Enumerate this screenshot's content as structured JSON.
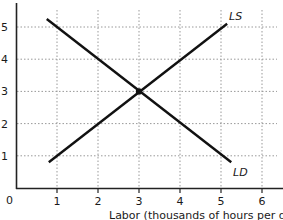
{
  "chart_data": {
    "type": "line",
    "title": "",
    "xlabel": "Labor (thousands of hours per day",
    "ylabel": "",
    "origin_label": "0",
    "xlim": [
      0,
      6.5
    ],
    "ylim": [
      0,
      5.7
    ],
    "x_ticks": [
      "1",
      "2",
      "3",
      "4",
      "5",
      "6"
    ],
    "y_ticks": [
      "1",
      "2",
      "3",
      "4",
      "5"
    ],
    "grid": true,
    "grid_style": "dotted",
    "series": [
      {
        "name": "LS",
        "label": "LS",
        "points": [
          [
            0.8,
            0.8
          ],
          [
            5.15,
            5.1
          ]
        ]
      },
      {
        "name": "LD",
        "label": "LD",
        "points": [
          [
            0.75,
            5.25
          ],
          [
            5.25,
            0.8
          ]
        ]
      }
    ],
    "annotations": [
      {
        "type": "equilibrium-point",
        "x": 3,
        "y": 3
      }
    ],
    "colors": {
      "line": "#111111",
      "grid": "#999999",
      "axis": "#222222"
    }
  }
}
